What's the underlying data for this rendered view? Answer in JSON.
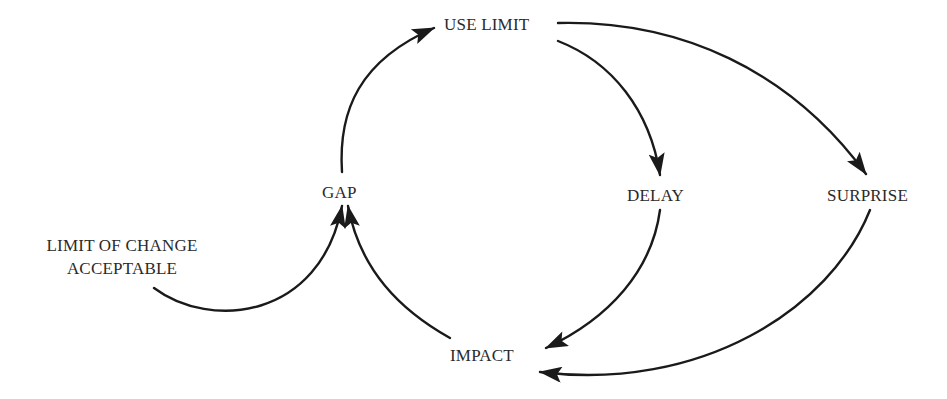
{
  "diagram": {
    "type": "causal-loop",
    "nodes": {
      "use_limit": "USE LIMIT",
      "gap": "GAP",
      "delay": "DELAY",
      "surprise": "SURPRISE",
      "impact": "IMPACT",
      "limit_line1": "LIMIT OF CHANGE",
      "limit_line2": "ACCEPTABLE"
    },
    "edges": [
      {
        "from": "GAP",
        "to": "USE LIMIT"
      },
      {
        "from": "USE LIMIT",
        "to": "DELAY"
      },
      {
        "from": "USE LIMIT",
        "to": "SURPRISE"
      },
      {
        "from": "DELAY",
        "to": "IMPACT"
      },
      {
        "from": "SURPRISE",
        "to": "IMPACT"
      },
      {
        "from": "IMPACT",
        "to": "GAP"
      },
      {
        "from": "LIMIT OF CHANGE ACCEPTABLE",
        "to": "GAP"
      }
    ],
    "colors": {
      "line": "#1a1a1a",
      "text": "#2a2a2a",
      "background": "#ffffff"
    }
  }
}
